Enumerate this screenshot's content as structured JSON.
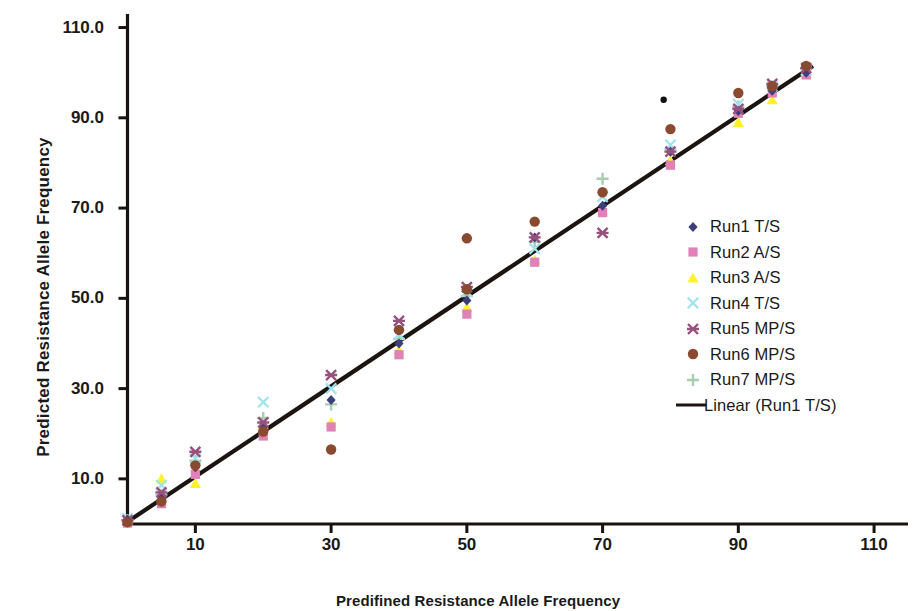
{
  "chart_data": {
    "type": "scatter",
    "title": "",
    "xlabel": "Predifined Resistance Allele Frequency",
    "ylabel": "Predicted Resistance Allele Frequency",
    "xlim": [
      0,
      115
    ],
    "ylim": [
      0,
      113
    ],
    "xticks": [
      10,
      30,
      50,
      70,
      90,
      110
    ],
    "yticks": [
      10.0,
      30.0,
      50.0,
      70.0,
      90.0,
      110.0
    ],
    "xtick_labels": [
      "10",
      "30",
      "50",
      "70",
      "90",
      "110"
    ],
    "ytick_labels": [
      "10.0",
      "30.0",
      "50.0",
      "70.0",
      "90.0",
      "110.0"
    ],
    "grid": false,
    "legend_position": "right",
    "trendline": {
      "name": "Linear (Run1 T/S)",
      "color": "#1c1410",
      "x_start": 0,
      "y_start": 0.5,
      "x_end": 101,
      "y_end": 101.5
    },
    "series": [
      {
        "name": "Run1 T/S",
        "marker": "diamond",
        "color": "#3b3f7a",
        "x": [
          0,
          5,
          10,
          20,
          30,
          40,
          50,
          60,
          70,
          80,
          90,
          95,
          100
        ],
        "y": [
          1.0,
          6.2,
          12.6,
          21.5,
          27.5,
          40.0,
          49.5,
          63.5,
          70.5,
          82.5,
          91.5,
          96.0,
          100.0
        ]
      },
      {
        "name": "Run2 A/S",
        "marker": "square",
        "color": "#e081b8",
        "x": [
          0,
          5,
          10,
          20,
          30,
          40,
          50,
          60,
          70,
          80,
          90,
          95,
          100
        ],
        "y": [
          0.2,
          4.5,
          11.0,
          19.5,
          21.5,
          37.5,
          46.5,
          58.0,
          69.0,
          79.5,
          91.0,
          95.5,
          99.5
        ]
      },
      {
        "name": "Run3 A/S",
        "marker": "triangle",
        "color": "#fff22d",
        "x": [
          0,
          5,
          10,
          20,
          30,
          40,
          50,
          60,
          70,
          80,
          90,
          95,
          100
        ],
        "y": [
          0.6,
          10.0,
          9.0,
          22.0,
          22.5,
          38.5,
          48.0,
          58.5,
          69.5,
          80.5,
          89.0,
          94.0,
          99.8
        ]
      },
      {
        "name": "Run4 T/S",
        "marker": "x-thin",
        "color": "#9fe3ef",
        "x": [
          0,
          5,
          10,
          20,
          30,
          40,
          50,
          60,
          70,
          80,
          90,
          95,
          100
        ],
        "y": [
          1.2,
          8.6,
          14.5,
          27.0,
          30.0,
          42.0,
          51.5,
          61.0,
          72.5,
          84.0,
          93.0,
          97.0,
          100.5
        ]
      },
      {
        "name": "Run5 MP/S",
        "marker": "star",
        "color": "#96517e",
        "x": [
          0,
          5,
          10,
          20,
          30,
          40,
          50,
          60,
          70,
          80,
          90,
          95,
          100
        ],
        "y": [
          0.8,
          7.0,
          16.0,
          22.5,
          33.0,
          45.0,
          52.5,
          63.5,
          64.5,
          82.5,
          92.0,
          97.5,
          101.0
        ]
      },
      {
        "name": "Run6 MP/S",
        "marker": "circle",
        "color": "#8a4a2f",
        "x": [
          0,
          5,
          10,
          20,
          30,
          40,
          50,
          50,
          60,
          70,
          80,
          90,
          95,
          100
        ],
        "y": [
          0.4,
          5.0,
          13.0,
          20.5,
          16.5,
          43.0,
          63.3,
          52.0,
          67.0,
          73.5,
          87.5,
          95.5,
          97.0,
          101.5
        ]
      },
      {
        "name": "Run7 MP/S",
        "marker": "plus",
        "color": "#a8ceb0",
        "x": [
          0,
          5,
          10,
          20,
          30,
          40,
          50,
          60,
          70,
          80,
          90,
          95,
          100
        ],
        "y": [
          0.9,
          6.5,
          14.0,
          23.5,
          26.5,
          41.0,
          50.5,
          62.5,
          76.5,
          83.0,
          92.5,
          97.0,
          100.8
        ]
      },
      {
        "name": "outlier",
        "marker": "dot",
        "color": "#111111",
        "x": [
          79
        ],
        "y": [
          94.0
        ]
      }
    ]
  },
  "axes": {
    "y_title": "Predicted Resistance Allele Frequency",
    "x_title": "Predifined Resistance Allele Frequency",
    "y_ticks": [
      "110.0",
      "90.0",
      "70.0",
      "50.0",
      "30.0",
      "10.0"
    ],
    "x_ticks": [
      "10",
      "30",
      "50",
      "70",
      "90",
      "110"
    ]
  },
  "legend": {
    "items": [
      {
        "label": "Run1 T/S",
        "marker": "diamond",
        "color": "#3b3f7a"
      },
      {
        "label": "Run2 A/S",
        "marker": "square",
        "color": "#e081b8"
      },
      {
        "label": "Run3 A/S",
        "marker": "triangle",
        "color": "#fff22d"
      },
      {
        "label": "Run4 T/S",
        "marker": "x-thin",
        "color": "#9fe3ef"
      },
      {
        "label": "Run5 MP/S",
        "marker": "star",
        "color": "#96517e"
      },
      {
        "label": "Run6 MP/S",
        "marker": "circle",
        "color": "#8a4a2f"
      },
      {
        "label": "Run7 MP/S",
        "marker": "plus",
        "color": "#a8ceb0"
      },
      {
        "label": "Linear (Run1 T/S)",
        "marker": "line",
        "color": "#1c1410"
      }
    ]
  }
}
